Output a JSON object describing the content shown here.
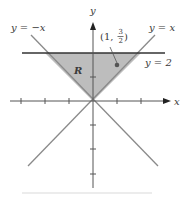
{
  "figure": {
    "axes": {
      "x_label": "x",
      "y_label": "y",
      "x_ticks": [
        -3,
        -2,
        -1,
        1,
        2
      ],
      "y_ticks": [
        -1,
        -2,
        -3,
        1
      ]
    },
    "curves": [
      {
        "id": "line-neg",
        "label": "y = −x"
      },
      {
        "id": "line-pos",
        "label": "y = x"
      },
      {
        "id": "line-horiz",
        "label": "y = 2"
      }
    ],
    "region": {
      "label": "R",
      "fill": "#bdbdbd"
    },
    "point": {
      "label_open": "(1, ",
      "num": "3",
      "den": "2",
      "label_close": ")",
      "x": 1,
      "y": 1.5
    },
    "colors": {
      "axis": "#444444",
      "diagonal": "#8a8a8a",
      "horizontal": "#333333",
      "region": "#bdbdbd",
      "point": "#555555"
    }
  }
}
